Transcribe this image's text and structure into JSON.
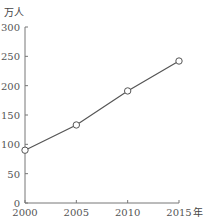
{
  "chart_data": {
    "type": "line",
    "title": "",
    "xlabel": "年",
    "ylabel": "万人",
    "categories": [
      "2000",
      "2005",
      "2010",
      "2015"
    ],
    "x": [
      2000,
      2005,
      2010,
      2015
    ],
    "series": [
      {
        "name": "",
        "values": [
          90,
          133,
          191,
          242
        ]
      }
    ],
    "yticks": [
      0,
      50,
      100,
      150,
      200,
      250,
      300
    ],
    "ylim": [
      0,
      300
    ],
    "xlim": [
      2000,
      2015
    ],
    "grid": false,
    "legend": null,
    "marker": "hollow-circle"
  },
  "axis": {
    "y_unit": "万人",
    "x_unit": "年",
    "y_tick_labels": [
      "0",
      "50",
      "100",
      "150",
      "200",
      "250",
      "300"
    ],
    "x_tick_labels": [
      "2000",
      "2005",
      "2010",
      "2015"
    ]
  },
  "colors": {
    "line": "#555555",
    "axis": "#777777",
    "marker_fill": "#ffffff"
  }
}
